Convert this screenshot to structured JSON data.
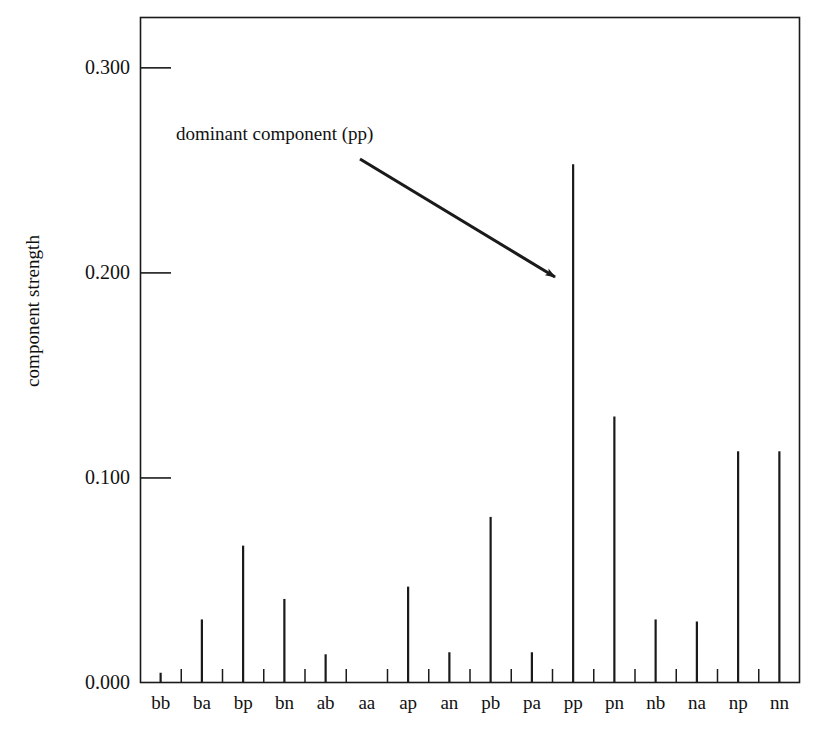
{
  "chart_data": {
    "type": "bar",
    "title": "",
    "subtitle": "",
    "xlabel": "",
    "ylabel": "component strength",
    "categories": [
      "bb",
      "ba",
      "bp",
      "bn",
      "ab",
      "aa",
      "ap",
      "an",
      "pb",
      "pa",
      "pp",
      "pn",
      "nb",
      "na",
      "np",
      "nn"
    ],
    "values": [
      0.005,
      0.031,
      0.067,
      0.041,
      0.014,
      0.0,
      0.047,
      0.015,
      0.081,
      0.015,
      0.253,
      0.13,
      0.031,
      0.03,
      0.113,
      0.113
    ],
    "ylim": [
      0.0,
      0.3248
    ],
    "xlim": [
      0,
      16
    ],
    "yticks": [
      0.0,
      0.1,
      0.2,
      0.3
    ],
    "ytick_labels": [
      "0.000",
      "0.100",
      "0.200",
      "0.300"
    ],
    "grid": false,
    "legend": null,
    "series_style": "stem",
    "annotations": [
      {
        "name": "dominant-component-callout",
        "text": "dominant component (pp)",
        "points_to": "pp",
        "arrow_from": [
          360,
          159
        ],
        "arrow_to": [
          561,
          281
        ]
      }
    ],
    "colors": {
      "bar": "#1a1a1a",
      "axis": "#1a1a1a",
      "text": "#111111",
      "background": "#ffffff"
    }
  },
  "axes": {
    "frame": {
      "left": 140,
      "right": 800,
      "top": 17,
      "bottom": 683
    }
  }
}
